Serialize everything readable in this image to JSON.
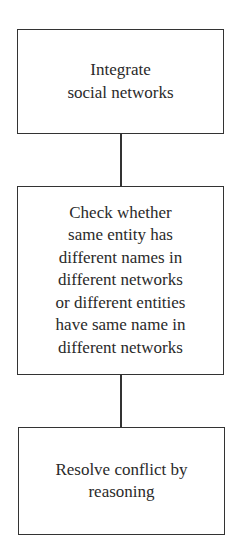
{
  "diagram": {
    "type": "flowchart",
    "direction": "top-to-bottom",
    "nodes": [
      {
        "id": "integrate",
        "lines": [
          "Integrate",
          "social networks"
        ]
      },
      {
        "id": "check",
        "lines": [
          "Check whether",
          "same entity has",
          "different names in",
          "different networks",
          "or different entities",
          "have same name in",
          "different networks"
        ]
      },
      {
        "id": "resolve",
        "lines": [
          "Resolve conflict by",
          "reasoning"
        ]
      }
    ],
    "edges": [
      {
        "from": "integrate",
        "to": "check"
      },
      {
        "from": "check",
        "to": "resolve"
      }
    ]
  }
}
